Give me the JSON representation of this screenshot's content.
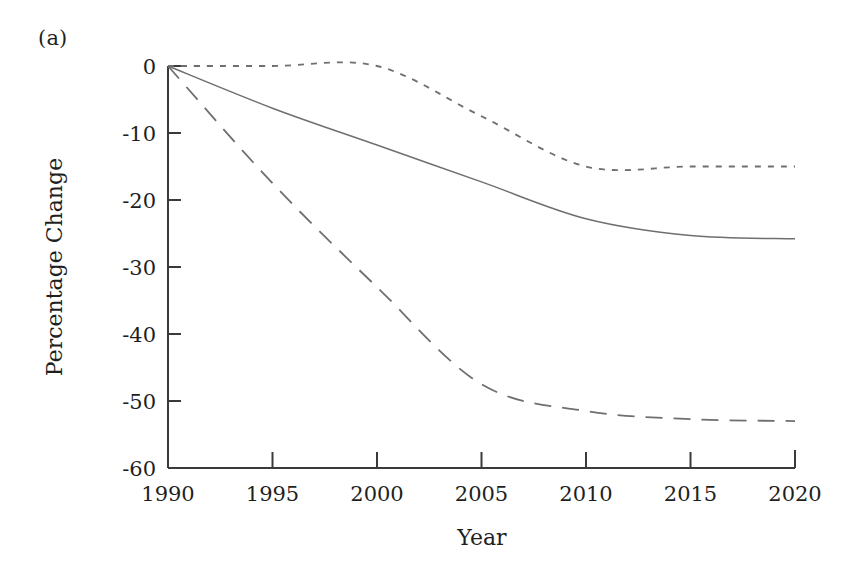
{
  "figure": {
    "panel_label": "(a)",
    "background_color": "#ffffff",
    "line_color": "#6f6f6f",
    "axis_color": "#3a3a3a"
  },
  "chart_data": {
    "type": "line",
    "title": "",
    "xlabel": "Year",
    "ylabel": "Percentage Change",
    "xlim": [
      1990,
      2020
    ],
    "ylim": [
      -60,
      0
    ],
    "xticks": [
      1990,
      1995,
      2000,
      2005,
      2010,
      2015,
      2020
    ],
    "xtick_labels": [
      "1990",
      "1995",
      "2000",
      "2005",
      "2010",
      "2015",
      "2020"
    ],
    "yticks": [
      0,
      -10,
      -20,
      -30,
      -40,
      -50,
      -60
    ],
    "ytick_labels": [
      "0",
      "-10",
      "-20",
      "-30",
      "-40",
      "-50",
      "-60"
    ],
    "grid": false,
    "legend": "none",
    "x": [
      1990,
      1995,
      2000,
      2005,
      2010,
      2015,
      2020
    ],
    "series": [
      {
        "name": "dotted-series",
        "style": "dotted",
        "values": [
          0,
          0,
          0,
          -7.5,
          -15,
          -15,
          -15
        ]
      },
      {
        "name": "solid-series",
        "style": "solid",
        "values": [
          0,
          -6.3,
          -11.8,
          -17.3,
          -22.8,
          -25.3,
          -25.8
        ]
      },
      {
        "name": "dashed-series",
        "style": "dashed",
        "values": [
          0,
          -17.5,
          -33,
          -47.5,
          -51.5,
          -52.7,
          -53
        ]
      }
    ]
  }
}
